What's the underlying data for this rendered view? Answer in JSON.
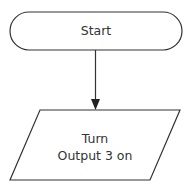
{
  "diagram": {
    "type": "flowchart",
    "nodes": [
      {
        "id": "start",
        "shape": "terminator",
        "label": "Start"
      },
      {
        "id": "turn-output",
        "shape": "parallelogram",
        "label_line1": "Turn",
        "label_line2": "Output 3 on"
      }
    ],
    "edges": [
      {
        "from": "start",
        "to": "turn-output",
        "arrow": true
      }
    ],
    "colors": {
      "stroke": "#333333",
      "text": "#333333",
      "background": "#ffffff"
    }
  }
}
